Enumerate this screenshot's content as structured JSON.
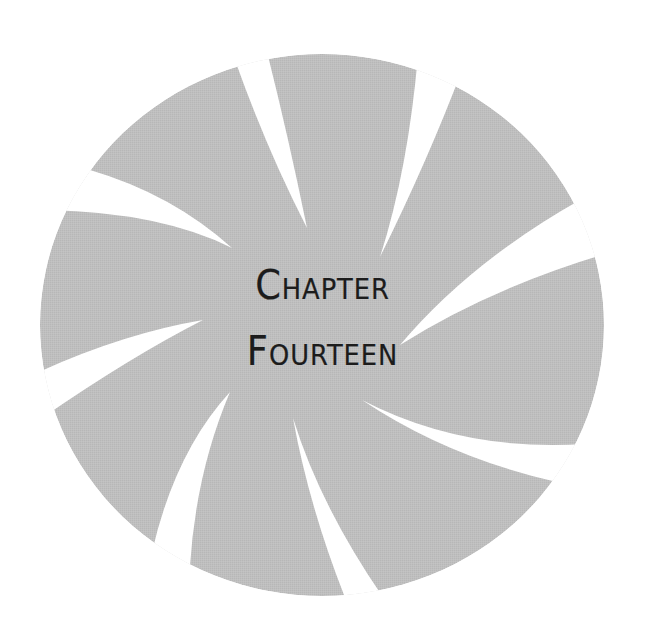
{
  "page": {
    "background": "#ffffff"
  },
  "emblem": {
    "type": "pinwheel-disc",
    "icon": "pinwheel-swirl-icon",
    "fill_color": "#bdbdbd",
    "cut_color": "#ffffff",
    "cut_count": 8
  },
  "heading": {
    "line1": "Chapter",
    "line2": "Fourteen",
    "text_color": "#1c1c1c"
  }
}
